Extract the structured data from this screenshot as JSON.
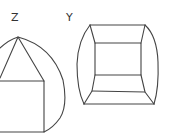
{
  "figures": [
    {
      "id": "Z",
      "label": "Z",
      "description": "triangle atop a square inside a circular arc outline"
    },
    {
      "id": "Y",
      "label": "Y",
      "description": "rounded box projection with inner rectangle and trapezoid bands"
    }
  ],
  "colors": {
    "stroke": "#444444",
    "background": "#ffffff",
    "label": "#333333"
  }
}
